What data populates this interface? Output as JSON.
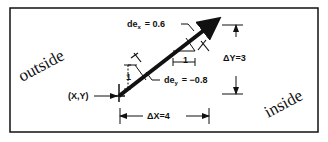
{
  "diagram": {
    "title": "",
    "regions": {
      "outside_label": "outside",
      "inside_label": "inside"
    },
    "point": {
      "label": "(X,Y)"
    },
    "vector": {
      "dx_label": "ΔX=4",
      "dy_label": "ΔY=3"
    },
    "direction_cosines": {
      "dex_prefix": "de",
      "dex_sub": "x",
      "dex_value": "=  0.6",
      "dey_prefix": "de",
      "dey_sub": "y",
      "dey_value": "=  −0.8"
    },
    "unit_labels": {
      "horizontal": "1",
      "vertical": "1"
    },
    "colors": {
      "ink": "#111111",
      "background": "#ffffff"
    }
  }
}
